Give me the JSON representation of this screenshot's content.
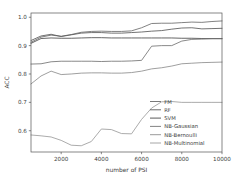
{
  "chart_data": {
    "type": "line",
    "title": "",
    "xlabel": "number of PSI",
    "ylabel": "ACC",
    "xlim": [
      500,
      10000
    ],
    "ylim": [
      0.525,
      1.015
    ],
    "grid": false,
    "legend_position": "lower right",
    "xticks": [
      2000,
      4000,
      6000,
      8000,
      10000
    ],
    "xtick_labels": [
      "2000",
      "4000",
      "6000",
      "8000",
      "10000"
    ],
    "yticks": [
      0.6,
      0.7,
      0.8,
      0.9,
      1.0
    ],
    "ytick_labels": [
      "0.6",
      "0.7",
      "0.8",
      "0.9",
      "1.0"
    ],
    "x": [
      500,
      1000,
      1500,
      2000,
      2500,
      3000,
      3500,
      4000,
      4500,
      5000,
      5500,
      6000,
      6500,
      7000,
      7500,
      8000,
      8500,
      9000,
      9500,
      10000
    ],
    "series": [
      {
        "name": "FM",
        "color": "#6b6b6b",
        "values": [
          0.912,
          0.93,
          0.937,
          0.933,
          0.939,
          0.947,
          0.95,
          0.951,
          0.95,
          0.95,
          0.952,
          0.963,
          0.978,
          0.979,
          0.979,
          0.981,
          0.983,
          0.982,
          0.985,
          0.987
        ]
      },
      {
        "name": "RF",
        "color": "#5a5a5a",
        "values": [
          0.918,
          0.934,
          0.94,
          0.932,
          0.938,
          0.944,
          0.946,
          0.946,
          0.944,
          0.944,
          0.946,
          0.948,
          0.951,
          0.953,
          0.958,
          0.962,
          0.963,
          0.959,
          0.96,
          0.961
        ]
      },
      {
        "name": "SVM",
        "color": "#4a4a4a",
        "values": [
          0.908,
          0.925,
          0.927,
          0.926,
          0.926,
          0.927,
          0.928,
          0.928,
          0.927,
          0.927,
          0.927,
          0.927,
          0.927,
          0.927,
          0.927,
          0.926,
          0.926,
          0.925,
          0.925,
          0.925
        ]
      },
      {
        "name": "NB-Gaussian",
        "color": "#747474",
        "values": [
          0.835,
          0.836,
          0.843,
          0.845,
          0.845,
          0.845,
          0.845,
          0.844,
          0.845,
          0.845,
          0.846,
          0.848,
          0.898,
          0.9,
          0.9,
          0.916,
          0.922,
          0.923,
          0.924,
          0.924
        ]
      },
      {
        "name": "NB-Bernoulli",
        "color": "#8e8e8e",
        "values": [
          0.765,
          0.793,
          0.81,
          0.798,
          0.8,
          0.803,
          0.804,
          0.804,
          0.803,
          0.803,
          0.805,
          0.81,
          0.818,
          0.822,
          0.828,
          0.836,
          0.838,
          0.84,
          0.841,
          0.842
        ]
      },
      {
        "name": "NB-Multinomial",
        "color": "#9c9c9c",
        "values": [
          0.585,
          0.582,
          0.578,
          0.566,
          0.549,
          0.547,
          0.562,
          0.606,
          0.604,
          0.59,
          0.589,
          0.64,
          0.68,
          0.702,
          0.703,
          0.7,
          0.7,
          0.7,
          0.7,
          0.7
        ]
      }
    ]
  }
}
